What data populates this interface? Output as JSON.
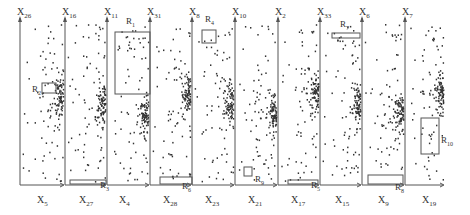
{
  "diagram": {
    "type": "chained-scatterplots",
    "top_axes": [
      {
        "name": "X",
        "sub": "26",
        "x": 20
      },
      {
        "name": "X",
        "sub": "16",
        "x": 65
      },
      {
        "name": "X",
        "sub": "11",
        "x": 107
      },
      {
        "name": "X",
        "sub": "31",
        "x": 150
      },
      {
        "name": "X",
        "sub": "8",
        "x": 192
      },
      {
        "name": "X",
        "sub": "10",
        "x": 235
      },
      {
        "name": "X",
        "sub": "2",
        "x": 278
      },
      {
        "name": "X",
        "sub": "33",
        "x": 320
      },
      {
        "name": "X",
        "sub": "6",
        "x": 362
      },
      {
        "name": "X",
        "sub": "7",
        "x": 405
      }
    ],
    "bottom_axes": [
      {
        "name": "X",
        "sub": "5",
        "x": 42
      },
      {
        "name": "X",
        "sub": "27",
        "x": 84
      },
      {
        "name": "X",
        "sub": "4",
        "x": 124
      },
      {
        "name": "X",
        "sub": "28",
        "x": 168
      },
      {
        "name": "X",
        "sub": "23",
        "x": 210
      },
      {
        "name": "X",
        "sub": "21",
        "x": 253
      },
      {
        "name": "X",
        "sub": "17",
        "x": 296
      },
      {
        "name": "X",
        "sub": "15",
        "x": 340
      },
      {
        "name": "X",
        "sub": "9",
        "x": 383
      },
      {
        "name": "X",
        "sub": "19",
        "x": 427
      }
    ],
    "regions": [
      {
        "name": "R",
        "sub": "1",
        "x": 115,
        "y": 32,
        "w": 35,
        "h": 62,
        "lx": 126,
        "ly": 20
      },
      {
        "name": "R",
        "sub": "2",
        "x": 42,
        "y": 83,
        "w": 14,
        "h": 10,
        "lx": 32,
        "ly": 88
      },
      {
        "name": "R",
        "sub": "3",
        "x": 70,
        "y": 180,
        "w": 36,
        "h": 4,
        "lx": 100,
        "ly": 184
      },
      {
        "name": "R",
        "sub": "4",
        "x": 202,
        "y": 30,
        "w": 14,
        "h": 13,
        "lx": 205,
        "ly": 18
      },
      {
        "name": "R",
        "sub": "5",
        "x": 288,
        "y": 180,
        "w": 30,
        "h": 4,
        "lx": 311,
        "ly": 184
      },
      {
        "name": "R",
        "sub": "6",
        "x": 160,
        "y": 177,
        "w": 32,
        "h": 7,
        "lx": 182,
        "ly": 185
      },
      {
        "name": "R",
        "sub": "7",
        "x": 332,
        "y": 33,
        "w": 28,
        "h": 5,
        "lx": 340,
        "ly": 23
      },
      {
        "name": "R",
        "sub": "8",
        "x": 368,
        "y": 175,
        "w": 35,
        "h": 9,
        "lx": 395,
        "ly": 186
      },
      {
        "name": "R",
        "sub": "9",
        "x": 244,
        "y": 167,
        "w": 8,
        "h": 9,
        "lx": 255,
        "ly": 178
      },
      {
        "name": "R",
        "sub": "10",
        "x": 421,
        "y": 118,
        "w": 18,
        "h": 36,
        "lx": 441,
        "ly": 139
      }
    ],
    "plot": {
      "top": 24,
      "bottom": 185,
      "arrow_right_x_offset": 0
    }
  }
}
